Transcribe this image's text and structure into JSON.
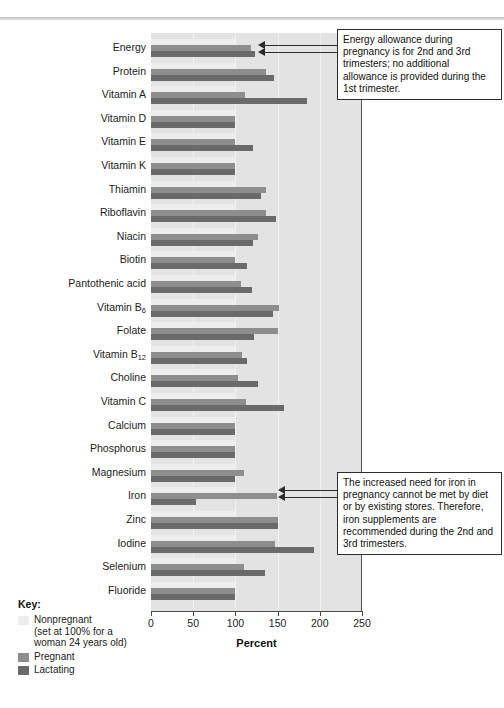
{
  "chart_data": {
    "type": "bar",
    "orientation": "horizontal",
    "title": "",
    "xlabel": "Percent",
    "ylabel": "",
    "xlim": [
      0,
      250
    ],
    "xticks": [
      0,
      50,
      100,
      150,
      200,
      250
    ],
    "grid": true,
    "legend_position": "bottom-left",
    "categories": [
      "Energy",
      "Protein",
      "Vitamin A",
      "Vitamin D",
      "Vitamin E",
      "Vitamin K",
      "Thiamin",
      "Riboflavin",
      "Niacin",
      "Biotin",
      "Pantothenic acid",
      "Vitamin B6",
      "Folate",
      "Vitamin B12",
      "Choline",
      "Vitamin C",
      "Calcium",
      "Phosphorus",
      "Magnesium",
      "Iron",
      "Zinc",
      "Iodine",
      "Selenium",
      "Fluoride"
    ],
    "categories_html": [
      "Energy",
      "Protein",
      "Vitamin A",
      "Vitamin D",
      "Vitamin E",
      "Vitamin K",
      "Thiamin",
      "Riboflavin",
      "Niacin",
      "Biotin",
      "Pantothenic acid",
      "Vitamin B<sub>6</sub>",
      "Folate",
      "Vitamin B<sub>12</sub>",
      "Choline",
      "Vitamin C",
      "Calcium",
      "Phosphorus",
      "Magnesium",
      "Iron",
      "Zinc",
      "Iodine",
      "Selenium",
      "Fluoride"
    ],
    "series": [
      {
        "name": "Nonpregnant",
        "color": "#ededed",
        "values": [
          100,
          100,
          100,
          100,
          100,
          100,
          100,
          100,
          100,
          100,
          100,
          100,
          100,
          100,
          100,
          100,
          100,
          100,
          100,
          100,
          100,
          100,
          100,
          100
        ]
      },
      {
        "name": "Pregnant",
        "color": "#8e8e8e",
        "values": [
          118,
          136,
          111,
          100,
          100,
          100,
          136,
          136,
          127,
          100,
          107,
          152,
          150,
          108,
          103,
          113,
          100,
          100,
          110,
          149,
          150,
          147,
          110,
          100
        ]
      },
      {
        "name": "Lactating",
        "color": "#6a6a6a",
        "values": [
          123,
          146,
          185,
          100,
          121,
          100,
          130,
          148,
          121,
          114,
          120,
          145,
          122,
          114,
          127,
          157,
          100,
          100,
          100,
          53,
          150,
          193,
          135,
          100
        ]
      }
    ]
  },
  "legend": {
    "title": "Key:",
    "items": [
      {
        "label": "Nonpregnant",
        "sublabel_1": "(set at 100% for a",
        "sublabel_2": "woman 24 years old)",
        "color": "#ededed"
      },
      {
        "label": "Pregnant",
        "sublabel_1": "",
        "sublabel_2": "",
        "color": "#8e8e8e"
      },
      {
        "label": "Lactating",
        "sublabel_1": "",
        "sublabel_2": "",
        "color": "#6a6a6a"
      }
    ]
  },
  "callouts": {
    "energy": "Energy allowance during pregnancy is for 2nd and 3rd trimesters; no additional allowance is provided during the 1st trimester.",
    "iron": "The increased need for iron in pregnancy cannot be met by diet or by existing stores. Therefore, iron supplements are recommended during the 2nd and 3rd trimesters."
  }
}
